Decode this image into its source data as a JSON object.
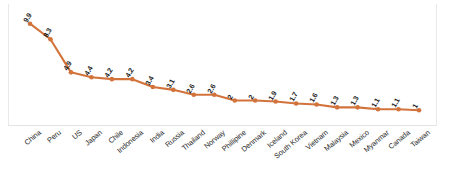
{
  "chart_data": {
    "type": "line",
    "title": "",
    "subtitle": "",
    "xlabel": "",
    "ylabel": "",
    "ylim": [
      0,
      11
    ],
    "grid": false,
    "legend": "none",
    "series_color": "#d3733c",
    "marker": "circle",
    "data_labels": true,
    "categories": [
      "China",
      "Peru",
      "US",
      "Japan",
      "Chile",
      "Indonesia",
      "India",
      "Russia",
      "Thailand",
      "Norway",
      "Phillipine",
      "Denmark",
      "Iceland",
      "South Korea",
      "Vietnam",
      "Malaysia",
      "Mexico",
      "Myanmar",
      "Canada",
      "Taiwan"
    ],
    "values": [
      9.9,
      8.3,
      4.9,
      4.4,
      4.2,
      4.2,
      3.4,
      3.1,
      2.6,
      2.6,
      2,
      2,
      1.9,
      1.7,
      1.6,
      1.3,
      1.3,
      1.1,
      1.1,
      1
    ],
    "value_labels": [
      "9.9",
      "8.3",
      "4.9",
      "4.4",
      "4.2",
      "4.2",
      "3.4",
      "3.1",
      "2.6",
      "2.6",
      "2",
      "2",
      "1.9",
      "1.7",
      "1.6",
      "1.3",
      "1.3",
      "1.1",
      "1.1",
      "1"
    ]
  },
  "colors": {
    "series": "#d3733c",
    "marker": "#d3733c",
    "frame": "#e9e9e9",
    "axis": "#e3e3e3",
    "label_text": "#1d1d1d",
    "category_text": "#2a2a2a",
    "background": "#ffffff"
  }
}
